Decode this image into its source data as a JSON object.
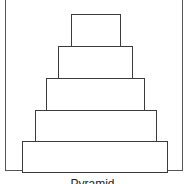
{
  "diagram": {
    "title": "Pyramid",
    "tiers": [
      {
        "level": 1,
        "position": "top"
      },
      {
        "level": 2
      },
      {
        "level": 3
      },
      {
        "level": 4
      },
      {
        "level": 5,
        "position": "base"
      }
    ],
    "colors": {
      "stroke": "#3a3a3a",
      "fill": "#ffffff",
      "background": "#ffffff"
    }
  }
}
